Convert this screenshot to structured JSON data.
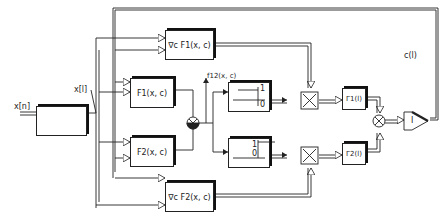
{
  "diagram": {
    "type": "block-diagram",
    "input": {
      "label": "x[n]"
    },
    "sampled_signal": {
      "label": "x[l]"
    },
    "blocks": {
      "window": {
        "label": "rect-pulse",
        "icon": "pulse-icon"
      },
      "grad_f1": {
        "label": "∇c F1(x, c)"
      },
      "f1": {
        "label": "F1(x, c)"
      },
      "f2": {
        "label": "F2(x, c)"
      },
      "grad_f2": {
        "label": "∇c F2(x, c)"
      },
      "comparator1": {
        "labels": [
          "1",
          "0"
        ]
      },
      "comparator2": {
        "labels": [
          "1",
          "0"
        ]
      },
      "gamma1": {
        "label": "Γ1(l)"
      },
      "gamma2": {
        "label": "Γ2(l)"
      },
      "integrator": {
        "label": "I"
      }
    },
    "signals": {
      "f12": {
        "label": "f12(x, c)"
      },
      "c_feedback": {
        "label": "c(l)"
      }
    },
    "colors": {
      "line": "#222222",
      "background": "#ffffff"
    }
  }
}
